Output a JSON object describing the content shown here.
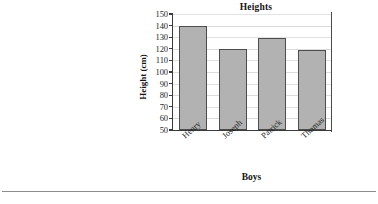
{
  "chart_data": {
    "type": "bar",
    "title": "Heights",
    "xlabel": "Boys",
    "ylabel": "Height (cm)",
    "categories": [
      "Henry",
      "Joseph",
      "Patrick",
      "Thomas"
    ],
    "values": [
      140,
      120,
      129,
      119
    ],
    "ylim": [
      50,
      150
    ],
    "ytick_labels": [
      "150",
      "140",
      "130",
      "120",
      "110",
      "100",
      "90",
      "80",
      "70",
      "60",
      "50"
    ],
    "ytick_values": [
      150,
      140,
      130,
      120,
      110,
      100,
      90,
      80,
      70,
      60,
      50
    ],
    "ytick_step": 10,
    "grid": true,
    "legend": false,
    "bar_fill": "#b2b2b2",
    "bar_border": "#4d4d4d",
    "axis_color": "#3a3a3a",
    "gridline_color": "#e2e2e2",
    "background": "#ffffff"
  },
  "page": {
    "divider_name": "horizontal-rule"
  }
}
